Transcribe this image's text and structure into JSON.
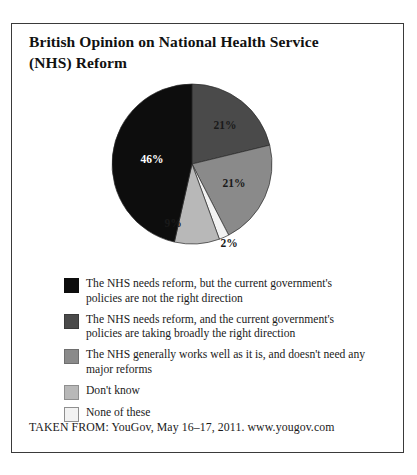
{
  "figure": {
    "title": "British Opinion on National Health Service (NHS) Reform",
    "source": "TAKEN FROM: YouGov, May 16–17, 2011. www.yougov.com"
  },
  "chart_data": {
    "type": "pie",
    "title": "British Opinion on National Health Service (NHS) Reform",
    "xlabel": "",
    "ylabel": "",
    "legend_position": "bottom-left",
    "grid": false,
    "start_angle_deg": 0,
    "direction": "clockwise",
    "categories": [
      "The NHS needs reform, and the current government's policies are taking broadly the right direction",
      "The NHS generally works well as it is, and doesn't need any major reforms",
      "None of these",
      "Don't know",
      "The NHS needs reform, but the current government's policies are not the right direction"
    ],
    "values": [
      21,
      21,
      2,
      9,
      46
    ],
    "value_labels": [
      "21%",
      "21%",
      "2%",
      "9%",
      "46%"
    ],
    "colors": [
      "#4a4a4a",
      "#8a8a8a",
      "#f2f2f2",
      "#b8b8b8",
      "#0d0d0d"
    ],
    "units": "percent"
  },
  "legend": {
    "items": [
      {
        "color": "#0d0d0d",
        "border": "#0d0d0d",
        "label": "The NHS needs reform, but the current government's policies are not the right direction"
      },
      {
        "color": "#4a4a4a",
        "border": "#3a3a3a",
        "label": "The NHS needs reform, and the current government's policies are taking broadly the right direction"
      },
      {
        "color": "#8a8a8a",
        "border": "#6e6e6e",
        "label": "The NHS generally works well as it is, and doesn't need any major reforms"
      },
      {
        "color": "#b8b8b8",
        "border": "#8f8f8f",
        "label": "Don't know"
      },
      {
        "color": "#f2f2f2",
        "border": "#8f8f8f",
        "label": "None of these"
      }
    ]
  },
  "pie_labels": [
    {
      "text": "21%",
      "x": 118,
      "y": 50,
      "tone": "on-light"
    },
    {
      "text": "21%",
      "x": 127,
      "y": 108,
      "tone": "on-light"
    },
    {
      "text": "9%",
      "x": 66,
      "y": 148,
      "tone": "on-light"
    },
    {
      "text": "2%",
      "x": 122,
      "y": 168,
      "tone": "on-light"
    },
    {
      "text": "46%",
      "x": 45,
      "y": 84,
      "tone": "on-dark"
    }
  ]
}
